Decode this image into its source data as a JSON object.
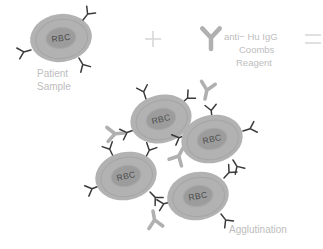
{
  "figure": {
    "title_visible": false,
    "background_color": "#ffffff",
    "colors": {
      "rbc_outer": "#b2b2b2",
      "rbc_inner": "#9a9a9a",
      "rbc_inner_ring": "#a8a8a8",
      "rbc_text": "#4a4a4a",
      "antibody_dark": "#3a3a3a",
      "reagent_gray": "#b0b0b0",
      "caption_text": "#bdbdbd",
      "operator_sign": "#d8d8d8"
    }
  },
  "equation": {
    "plus_sign": "+",
    "equals_sign": "=",
    "reagent_symbol_name": "antibody-y-glyph"
  },
  "labels": {
    "patient_sample_line1": "Patient",
    "patient_sample_line2": "Sample",
    "reagent_line1": "anti− Hu IgG",
    "reagent_line2": "Coombs",
    "reagent_line3": "Reagent",
    "result": "Agglutination"
  },
  "cells": {
    "rbc_text": "RBC",
    "patient_cell": {
      "cx": 61,
      "cy": 38,
      "rx": 31,
      "ry": 24,
      "rotate": -8
    },
    "cluster": [
      {
        "cx": 161,
        "cy": 119,
        "rx": 32,
        "ry": 25,
        "rotate": -14
      },
      {
        "cx": 212,
        "cy": 139,
        "rx": 30,
        "ry": 24,
        "rotate": -12
      },
      {
        "cx": 126,
        "cy": 176,
        "rx": 31,
        "ry": 24,
        "rotate": -12
      },
      {
        "cx": 198,
        "cy": 196,
        "rx": 31,
        "ry": 24,
        "rotate": -10
      }
    ]
  },
  "antibodies": {
    "patient_cell_count": 3,
    "cluster_bound_count": 14,
    "free_reagent_count": 4
  }
}
